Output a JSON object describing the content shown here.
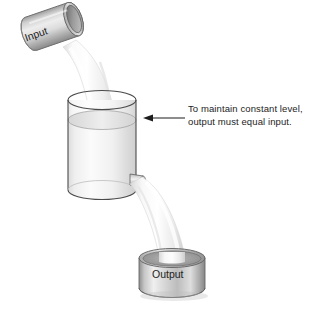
{
  "diagram": {
    "background_color": "#ffffff",
    "annotation": {
      "line1": "To maintain constant level,",
      "line2": "output must equal input.",
      "text_color": "#1d1d1d",
      "arrow_direction": "left",
      "arrow_target": "liquid-level-surface"
    },
    "input_vessel": {
      "label": "Input",
      "shape": "tilted-cylinder",
      "tilt_degrees": -19,
      "body_color": "#d8d8d8",
      "rim_color": "#8f8f8f"
    },
    "tank": {
      "label": "",
      "shape": "transparent-cylinder",
      "outline_color": "#4a4a4a",
      "liquid_fill_color": "#e8e8e8",
      "liquid_level_fraction": 0.72,
      "outlet": "bottom-right-spout"
    },
    "output_vessel": {
      "label": "Output",
      "shape": "short-cylinder-drum",
      "body_color": "#c9c9c9",
      "rim_color": "#8a8a8a"
    },
    "streams": [
      {
        "name": "input-stream",
        "from": "input_vessel",
        "to": "tank",
        "color": "#f3f3f3"
      },
      {
        "name": "output-stream",
        "from": "tank",
        "to": "output_vessel",
        "color": "#f3f3f3"
      }
    ]
  }
}
